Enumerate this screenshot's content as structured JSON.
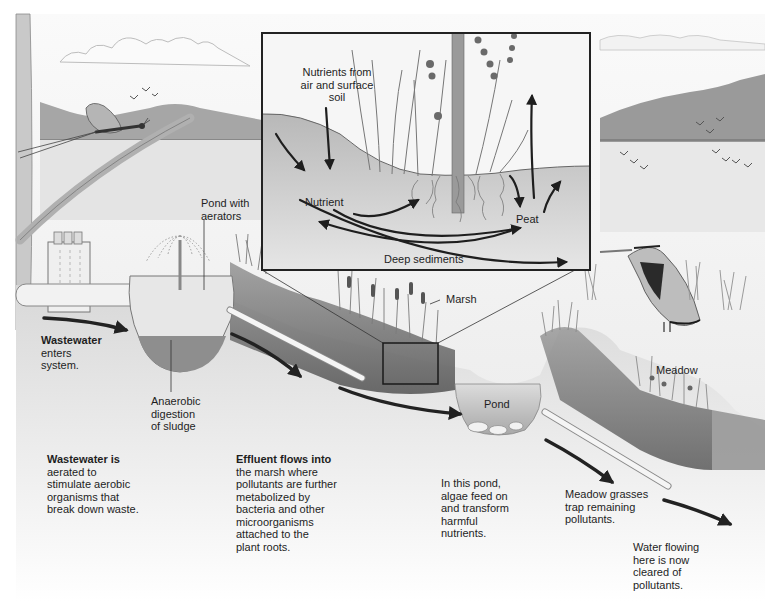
{
  "diagram": {
    "colors": {
      "background": "#ffffff",
      "sky": "#f4f4f4",
      "mountain": "#9e9e9e",
      "water": "#e6e6e6",
      "soil": "#8a8a8a",
      "soil_dark": "#5e5e5e",
      "arrow": "#1e1e1e",
      "inset_border": "#222222",
      "text": "#1e1e1e"
    },
    "inset": {
      "title_lines": [
        "Nutrients from",
        "air and surface",
        "soil"
      ],
      "nutrient": "Nutrient",
      "peat": "Peat",
      "deep_sediments": "Deep sediments"
    },
    "labels": {
      "pond_aerators": [
        "Pond with",
        "aerators"
      ],
      "wastewater_enters": {
        "bold": "Wastewater",
        "rest": [
          "enters",
          "system."
        ]
      },
      "anaerobic": [
        "Anaerobic",
        "digestion",
        "of sludge"
      ],
      "marsh": "Marsh",
      "pond": "Pond",
      "meadow": "Meadow"
    },
    "captions": [
      {
        "id": "aeration",
        "bold": "Wastewater is",
        "lines": [
          "aerated to",
          "stimulate aerobic",
          "organisms that",
          "break down waste."
        ]
      },
      {
        "id": "effluent",
        "bold": "Effluent flows into",
        "lines": [
          "the marsh where",
          "pollutants are further",
          "metabolized by",
          "bacteria and other",
          "microorganisms",
          "attached to the",
          "plant roots."
        ]
      },
      {
        "id": "pond",
        "bold": "",
        "lines": [
          "In this pond,",
          "algae feed on",
          "and transform",
          "harmful",
          "nutrients."
        ]
      },
      {
        "id": "meadow",
        "bold": "",
        "lines": [
          "Meadow grasses",
          "trap remaining",
          "pollutants."
        ]
      },
      {
        "id": "cleared",
        "bold": "",
        "lines": [
          "Water flowing",
          "here is now",
          "cleared of",
          "pollutants."
        ]
      }
    ],
    "illustrations": [
      "mayfly-icon",
      "heron-icon",
      "bird-flock-icon",
      "aerator-fountain-icon",
      "wastewater-tank-icon",
      "cattail-icon",
      "pipe-icon",
      "flow-arrow-icon"
    ]
  }
}
